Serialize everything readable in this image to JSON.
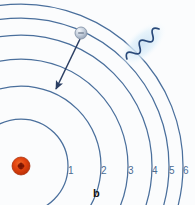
{
  "figure": {
    "caption": "b",
    "background_color": "#fbfcfd",
    "orbit_color": "#4a6f9c",
    "nucleus_color": "#e24410",
    "nucleus_core_color": "#8c1c05",
    "electron_color": "#b9c4d4",
    "photon_color": "#2a4a7a",
    "photon_glow_color": "#dbe9f5",
    "arrow_color": "#2c3f63"
  },
  "nucleus": {
    "name": "nucleus",
    "symbol": "+",
    "charge_label": "+",
    "cx": 21,
    "cy": 166,
    "r": 9
  },
  "electron": {
    "name": "electron",
    "symbol": "-",
    "charge_label": "–",
    "cx": 81,
    "cy": 33,
    "r": 6
  },
  "orbits": [
    {
      "n": 1,
      "label": "1",
      "radius": 47,
      "label_x": 68,
      "label_y": 170
    },
    {
      "n": 2,
      "label": "2",
      "radius": 80,
      "label_x": 101,
      "label_y": 170
    },
    {
      "n": 3,
      "label": "3",
      "radius": 107,
      "label_x": 128,
      "label_y": 170
    },
    {
      "n": 4,
      "label": "4",
      "radius": 131,
      "label_x": 152,
      "label_y": 170
    },
    {
      "n": 5,
      "label": "5",
      "radius": 148,
      "label_x": 169,
      "label_y": 170
    },
    {
      "n": 6,
      "label": "6",
      "radius": 162,
      "label_x": 183,
      "label_y": 170
    }
  ],
  "transition_arrow": {
    "name": "electron-transition-arrow",
    "from_x": 80,
    "from_y": 39,
    "to_x": 56,
    "to_y": 89,
    "description": "downward transition"
  },
  "photon": {
    "name": "emitted-photon",
    "description": "wavy emitted photon",
    "start_x": 124,
    "start_y": 62,
    "end_x": 162,
    "end_y": 26,
    "wave_count": 5
  }
}
